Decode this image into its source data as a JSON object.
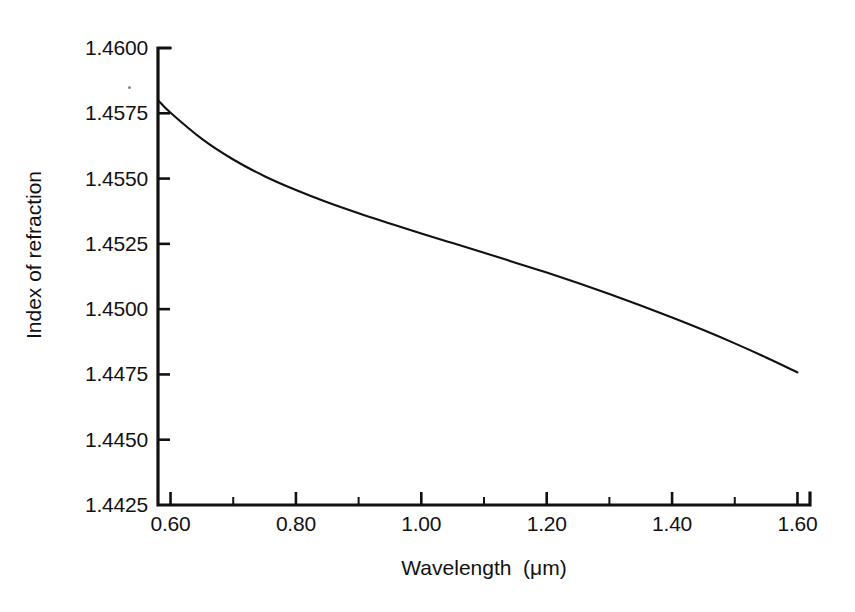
{
  "chart_data": {
    "type": "line",
    "title": "",
    "subtitle": "",
    "xlabel": "Wavelength  (μm)",
    "ylabel": "Index of refraction",
    "xlim": [
      0.58,
      1.62
    ],
    "ylim": [
      1.4425,
      1.46
    ],
    "xticks": [
      0.6,
      0.8,
      1.0,
      1.2,
      1.4,
      1.6
    ],
    "xticklabels": [
      "0.60",
      "0.80",
      "1.00",
      "1.20",
      "1.40",
      "1.60"
    ],
    "yticks": [
      1.4425,
      1.445,
      1.4475,
      1.45,
      1.4525,
      1.455,
      1.4575,
      1.46
    ],
    "yticklabels": [
      "1.4425",
      "1.4450",
      "1.4475",
      "1.4500",
      "1.4525",
      "1.4550",
      "1.4575",
      "1.4600"
    ],
    "x_minor_tick_interval": 0.1,
    "grid": false,
    "legend": null,
    "legend_position": "none",
    "tick_direction": "in",
    "line_color": "#111111",
    "axis_color": "#111111",
    "background_color": "#ffffff",
    "series": [
      {
        "name": "Index of refraction of fused silica",
        "x": [
          0.58,
          0.6,
          0.65,
          0.7,
          0.75,
          0.8,
          0.85,
          0.9,
          0.95,
          1.0,
          1.05,
          1.1,
          1.15,
          1.2,
          1.25,
          1.3,
          1.35,
          1.4,
          1.45,
          1.5,
          1.55,
          1.6
        ],
        "y": [
          1.458,
          1.45752,
          1.45652,
          1.45573,
          1.45509,
          1.45456,
          1.45409,
          1.45367,
          1.45328,
          1.4529,
          1.45253,
          1.45216,
          1.45178,
          1.4514,
          1.451,
          1.45058,
          1.45014,
          1.44968,
          1.4492,
          1.44869,
          1.44815,
          1.44758
        ]
      }
    ]
  },
  "figure": {
    "axis_title_x": "Wavelength  (μm)",
    "axis_title_y": "Index of refraction"
  }
}
